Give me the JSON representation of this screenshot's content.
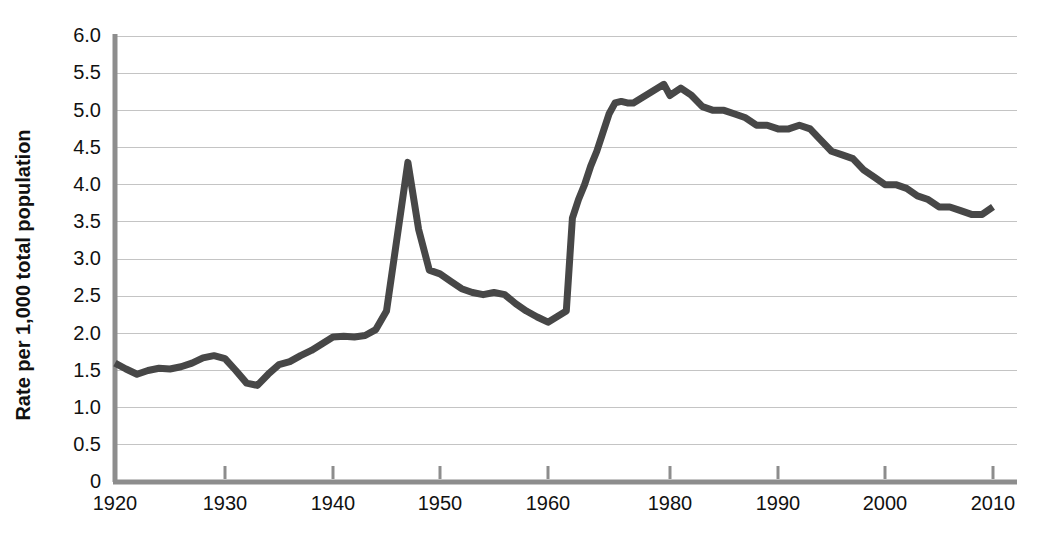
{
  "chart_data": {
    "type": "line",
    "title": "",
    "subtitle": "",
    "xlabel": "",
    "ylabel": "Rate per 1,000 total population",
    "xlim": [
      1920,
      2011
    ],
    "ylim": [
      0,
      6
    ],
    "grid": true,
    "legend": null,
    "legend_position": "none",
    "line_color": "#474747",
    "axis_color": "#8d8d8d",
    "grid_color": "#c4c4c4",
    "background_color": "#ffffff",
    "xticks": [
      1920,
      1930,
      1940,
      1950,
      1960,
      1980,
      1990,
      2000,
      2010
    ],
    "xtick_labels": [
      "1920",
      "1930",
      "1940",
      "1950",
      "1960",
      "1980",
      "1990",
      "2000",
      "2010"
    ],
    "yticks": [
      0,
      0.5,
      1.0,
      1.5,
      2.0,
      2.5,
      3.0,
      3.5,
      4.0,
      4.5,
      5.0,
      5.5,
      6.0
    ],
    "ytick_labels": [
      "0",
      "0.5",
      "1.0",
      "1.5",
      "2.0",
      "2.5",
      "3.0",
      "3.5",
      "4.0",
      "4.5",
      "5.0",
      "5.5",
      "6.0"
    ],
    "series": [
      {
        "name": "Rate per 1,000 total population",
        "x": [
          1920,
          1921,
          1922,
          1923,
          1924,
          1925,
          1926,
          1927,
          1928,
          1929,
          1930,
          1931,
          1932,
          1933,
          1934,
          1935,
          1936,
          1937,
          1938,
          1939,
          1940,
          1941,
          1942,
          1943,
          1944,
          1945,
          1946,
          1947,
          1948,
          1949,
          1950,
          1951,
          1952,
          1953,
          1954,
          1955,
          1956,
          1957,
          1958,
          1959,
          1960,
          1961,
          1962,
          1963,
          1964,
          1965,
          1966,
          1967,
          1968,
          1969,
          1970,
          1971,
          1972,
          1973,
          1974,
          1975,
          1976,
          1977,
          1978,
          1979,
          1980,
          1981,
          1982,
          1983,
          1984,
          1985,
          1986,
          1987,
          1988,
          1989,
          1990,
          1991,
          1992,
          1993,
          1994,
          1995,
          1996,
          1997,
          1998,
          1999,
          2000,
          2001,
          2002,
          2003,
          2004,
          2005,
          2006,
          2007,
          2008,
          2009,
          2010
        ],
        "y": [
          1.6,
          1.52,
          1.45,
          1.5,
          1.53,
          1.52,
          1.55,
          1.6,
          1.67,
          1.7,
          1.66,
          1.5,
          1.33,
          1.3,
          1.45,
          1.58,
          1.62,
          1.7,
          1.77,
          1.86,
          1.95,
          1.96,
          1.95,
          1.97,
          2.05,
          2.3,
          3.3,
          4.3,
          3.4,
          2.85,
          2.8,
          2.7,
          2.6,
          2.55,
          2.52,
          2.55,
          2.52,
          2.4,
          2.3,
          2.22,
          2.15,
          2.2,
          2.25,
          2.3,
          3.55,
          3.8,
          4.0,
          4.25,
          4.45,
          4.7,
          4.95,
          5.1,
          5.12,
          5.1,
          5.1,
          5.15,
          5.2,
          5.25,
          5.3,
          5.35,
          5.2,
          5.3,
          5.2,
          5.05,
          5.0,
          5.0,
          4.95,
          4.9,
          4.8,
          4.8,
          4.75,
          4.75,
          4.8,
          4.75,
          4.6,
          4.45,
          4.4,
          4.35,
          4.2,
          4.1,
          4.0,
          4.0,
          3.95,
          3.85,
          3.8,
          3.7,
          3.7,
          3.65,
          3.6,
          3.6,
          3.7
        ],
        "color": "#474747",
        "style": "solid",
        "width": 7
      }
    ],
    "annotations": [
      {
        "text": "Discontinuity in series between 1960 and 1961 (sharp step from about 2.25 to about 3.55)",
        "x": 1960.5,
        "y": 2.9
      }
    ],
    "notable_points": {
      "start_1920": 1.6,
      "depression_low_1932_1933": 1.3,
      "postwar_peak_1947": 4.3,
      "postwar_low_1958": 2.15,
      "series_break_low_1960": 2.25,
      "series_break_high_1961": 3.55,
      "peak_1979": 5.35,
      "secondary_peak_1981": 5.3,
      "end_2010": 3.7
    }
  },
  "geometry": {
    "plot_left": 115,
    "plot_right": 1005,
    "plot_top": 36,
    "plot_bottom": 482,
    "decade_px": 108,
    "unit_px": 74.3
  }
}
